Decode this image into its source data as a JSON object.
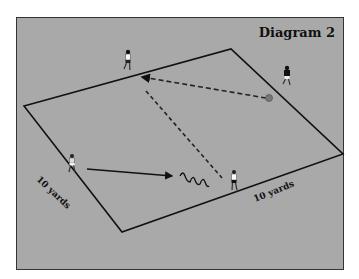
{
  "diagram": {
    "title": "Diagram 2",
    "background_color": "#a9a9a9",
    "field": {
      "corners": {
        "left": [
          24,
          106
        ],
        "top": [
          231,
          49
        ],
        "right": [
          343,
          154
        ],
        "bottom": [
          122,
          232
        ]
      },
      "label_left": "10 yards",
      "label_bottom": "10 yards"
    },
    "players": [
      {
        "id": "top",
        "x": 128,
        "y": 64,
        "shirt": "white"
      },
      {
        "id": "right",
        "x": 287,
        "y": 80,
        "shirt": "black"
      },
      {
        "id": "left",
        "x": 72,
        "y": 165,
        "shirt": "white"
      },
      {
        "id": "bottom",
        "x": 234,
        "y": 184,
        "shirt": "white"
      }
    ],
    "ball": {
      "x": 269,
      "y": 97
    },
    "paths": [
      {
        "type": "dashed-pass",
        "from": [
          266,
          98
        ],
        "to": [
          142,
          77
        ]
      },
      {
        "type": "dashed-run",
        "from": [
          146,
          91
        ],
        "to": [
          222,
          178
        ]
      },
      {
        "type": "solid-run",
        "from": [
          87,
          169
        ],
        "to": [
          172,
          176
        ]
      },
      {
        "type": "dribble",
        "from": [
          178,
          174
        ],
        "to": [
          210,
          185
        ]
      }
    ]
  }
}
